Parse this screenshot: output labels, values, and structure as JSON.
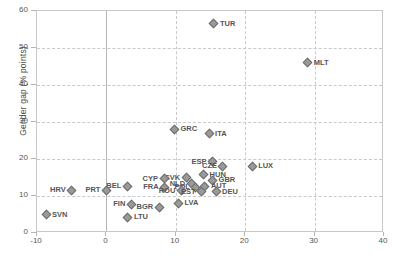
{
  "chart_data": {
    "type": "scatter",
    "title": "",
    "xlabel": "",
    "ylabel": "Gender gap (% points)",
    "xlim": [
      -10,
      40
    ],
    "ylim": [
      0,
      60
    ],
    "xticks": [
      "-10",
      "0",
      "10",
      "20",
      "30",
      "40"
    ],
    "yticks": [
      "0",
      "10",
      "20",
      "30",
      "40",
      "50",
      "60"
    ],
    "grid": "dashed horizontal and vertical gridlines at each tick",
    "legend": "none",
    "marker": "gray diamond",
    "points": [
      {
        "label": "TUR",
        "x": 15.5,
        "y": 56.5,
        "side": "right"
      },
      {
        "label": "MLT",
        "x": 29.0,
        "y": 46.0,
        "side": "right"
      },
      {
        "label": "GRC",
        "x": 9.8,
        "y": 28.0,
        "side": "right"
      },
      {
        "label": "ITA",
        "x": 14.8,
        "y": 26.8,
        "side": "right"
      },
      {
        "label": "ESP",
        "x": 15.3,
        "y": 19.3,
        "side": "left"
      },
      {
        "label": "CZE",
        "x": 16.8,
        "y": 18.0,
        "side": "left"
      },
      {
        "label": "LUX",
        "x": 21.0,
        "y": 18.0,
        "side": "right"
      },
      {
        "label": "HUN",
        "x": 14.0,
        "y": 15.8,
        "side": "right"
      },
      {
        "label": "GBR",
        "x": 15.3,
        "y": 14.3,
        "side": "right"
      },
      {
        "label": "SVK",
        "x": 11.5,
        "y": 15.0,
        "side": "left"
      },
      {
        "label": "CYP",
        "x": 8.3,
        "y": 14.7,
        "side": "left"
      },
      {
        "label": "NLD",
        "x": 12.2,
        "y": 13.3,
        "side": "left"
      },
      {
        "label": "AUT",
        "x": 14.2,
        "y": 12.6,
        "side": "right"
      },
      {
        "label": "POL",
        "x": 12.9,
        "y": 12.3,
        "side": "left"
      },
      {
        "label": "BEL",
        "x": 3.0,
        "y": 12.6,
        "side": "left"
      },
      {
        "label": "FRA",
        "x": 8.4,
        "y": 12.3,
        "side": "left"
      },
      {
        "label": "ROU",
        "x": 10.8,
        "y": 11.4,
        "side": "left"
      },
      {
        "label": "EST",
        "x": 13.7,
        "y": 11.2,
        "side": "left"
      },
      {
        "label": "DEU",
        "x": 15.8,
        "y": 11.2,
        "side": "right"
      },
      {
        "label": "PRT",
        "x": 0.0,
        "y": 11.6,
        "side": "left"
      },
      {
        "label": "HRV",
        "x": -5.0,
        "y": 11.6,
        "side": "left"
      },
      {
        "label": "LVA",
        "x": 10.4,
        "y": 8.1,
        "side": "right"
      },
      {
        "label": "FIN",
        "x": 3.6,
        "y": 7.8,
        "side": "left"
      },
      {
        "label": "BGR",
        "x": 7.6,
        "y": 7.0,
        "side": "left"
      },
      {
        "label": "LTU",
        "x": 3.1,
        "y": 4.3,
        "side": "right"
      },
      {
        "label": "SVN",
        "x": -8.7,
        "y": 5.0,
        "side": "right"
      }
    ]
  }
}
